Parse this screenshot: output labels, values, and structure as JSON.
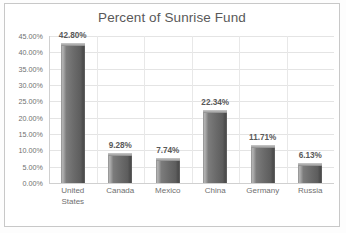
{
  "chart_data": {
    "type": "bar",
    "title": "Percent of Sunrise Fund",
    "xlabel": "",
    "ylabel": "",
    "categories": [
      "United States",
      "Canada",
      "Mexico",
      "China",
      "Germany",
      "Russia"
    ],
    "category_lines": [
      [
        "United",
        "States"
      ],
      [
        "Canada"
      ],
      [
        "Mexico"
      ],
      [
        "China"
      ],
      [
        "Germany"
      ],
      [
        "Russia"
      ]
    ],
    "values": [
      42.8,
      9.28,
      7.74,
      22.34,
      11.71,
      6.13
    ],
    "data_labels": [
      "42.80%",
      "9.28%",
      "7.74%",
      "22.34%",
      "11.71%",
      "6.13%"
    ],
    "ylim": [
      0,
      45
    ],
    "ytick_values": [
      0,
      5,
      10,
      15,
      20,
      25,
      30,
      35,
      40,
      45
    ],
    "ytick_labels": [
      "0.00%",
      "5.00%",
      "10.00%",
      "15.00%",
      "20.00%",
      "25.00%",
      "30.00%",
      "35.00%",
      "40.00%",
      "45.00%"
    ],
    "grid": true,
    "grid_axis": "both",
    "legend": false,
    "bar_color": "#6a6a6a",
    "text_color": "#595959",
    "grid_color": "#e4e4e4",
    "plot_background": "#ffffff"
  }
}
